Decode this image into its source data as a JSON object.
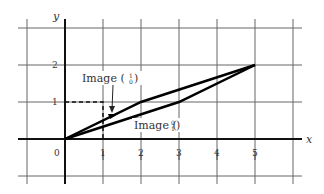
{
  "diagram": {
    "title": "",
    "axes": {
      "x_label": "x",
      "y_label": "y",
      "x_ticks": [
        "0",
        "1",
        "2",
        "3",
        "4",
        "5"
      ],
      "y_ticks": [
        "1",
        "2"
      ]
    },
    "labels": {
      "image_e1": {
        "prefix": "Image (",
        "top": "1",
        "bottom": "0",
        "suffix": ")"
      },
      "image_e2": {
        "prefix": "Image (",
        "top": "0",
        "bottom": "1",
        "suffix": ")"
      }
    },
    "shapes": {
      "unit_square": [
        [
          0,
          0
        ],
        [
          1,
          0
        ],
        [
          1,
          1
        ],
        [
          0,
          1
        ]
      ],
      "image_parallelogram": [
        [
          0,
          0
        ],
        [
          2,
          1
        ],
        [
          5,
          2
        ],
        [
          3,
          1
        ]
      ]
    },
    "colors": {
      "grid": "#555555",
      "axis": "#111111",
      "shape": "#000000",
      "text": "#333333"
    }
  }
}
